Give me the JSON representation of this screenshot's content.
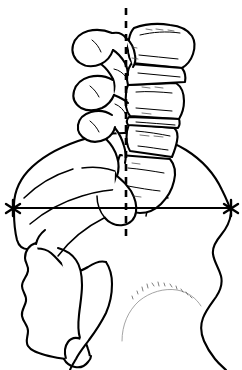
{
  "figure": {
    "title": "Lateral lumbosacral spine and pelvis line drawing",
    "background_color": "#ffffff",
    "line_color": "#000000"
  },
  "annotations": {
    "plumb_line": {
      "name": "vertical-dashed-plumb-line",
      "style": "dashed",
      "color": "#000000",
      "x": 126,
      "y_top": 8,
      "y_bottom": 236,
      "dash_pattern": "7 6",
      "stroke_width": 2.6
    },
    "reference_line": {
      "name": "horizontal-reference-line",
      "style": "solid",
      "color": "#000000",
      "y": 208,
      "x_start": 12,
      "x_end": 232,
      "stroke_width": 2.2
    },
    "markers": [
      {
        "name": "star-marker-left",
        "symbol": "asterisk",
        "x": 13,
        "y": 208,
        "color": "#000000"
      },
      {
        "name": "star-marker-right",
        "symbol": "asterisk",
        "x": 231,
        "y": 208,
        "color": "#000000"
      }
    ]
  },
  "anatomy": {
    "vertebrae": [
      {
        "name": "upper-lumbar-vertebra",
        "label": ""
      },
      {
        "name": "middle-lumbar-vertebra",
        "label": ""
      },
      {
        "name": "lower-lumbar-vertebra",
        "label": ""
      }
    ],
    "structures": [
      {
        "name": "spinous-processes",
        "label": ""
      },
      {
        "name": "intervertebral-discs",
        "label": ""
      },
      {
        "name": "iliac-crest",
        "label": ""
      },
      {
        "name": "sacrum",
        "label": ""
      },
      {
        "name": "coccyx",
        "label": ""
      },
      {
        "name": "femoral-head",
        "label": ""
      },
      {
        "name": "pelvic-outline",
        "label": ""
      }
    ]
  },
  "labels": {
    "text_items": []
  }
}
